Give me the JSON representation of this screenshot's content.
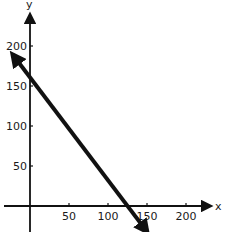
{
  "chart_data": {
    "type": "line",
    "title": "",
    "xlabel": "x",
    "ylabel": "y",
    "xlim": [
      -35,
      240
    ],
    "ylim": [
      -32,
      245
    ],
    "x_ticks": [
      50,
      100,
      150,
      200
    ],
    "y_ticks": [
      50,
      100,
      150,
      200
    ],
    "x_tick_labels": [
      "50",
      "100",
      "150",
      "200"
    ],
    "y_tick_labels": [
      "50",
      "100",
      "150",
      "200"
    ],
    "grid": false,
    "legend": "none",
    "series": [
      {
        "name": "line",
        "description": "Line with arrows at both ends; y-intercept 160, x-intercept 120",
        "equation": "y = 160 - (4/3) x",
        "x": [
          -22,
          150
        ],
        "y": [
          189,
          -32
        ],
        "y_intercept": 160,
        "x_intercept": 120,
        "color": "#111111"
      }
    ]
  }
}
